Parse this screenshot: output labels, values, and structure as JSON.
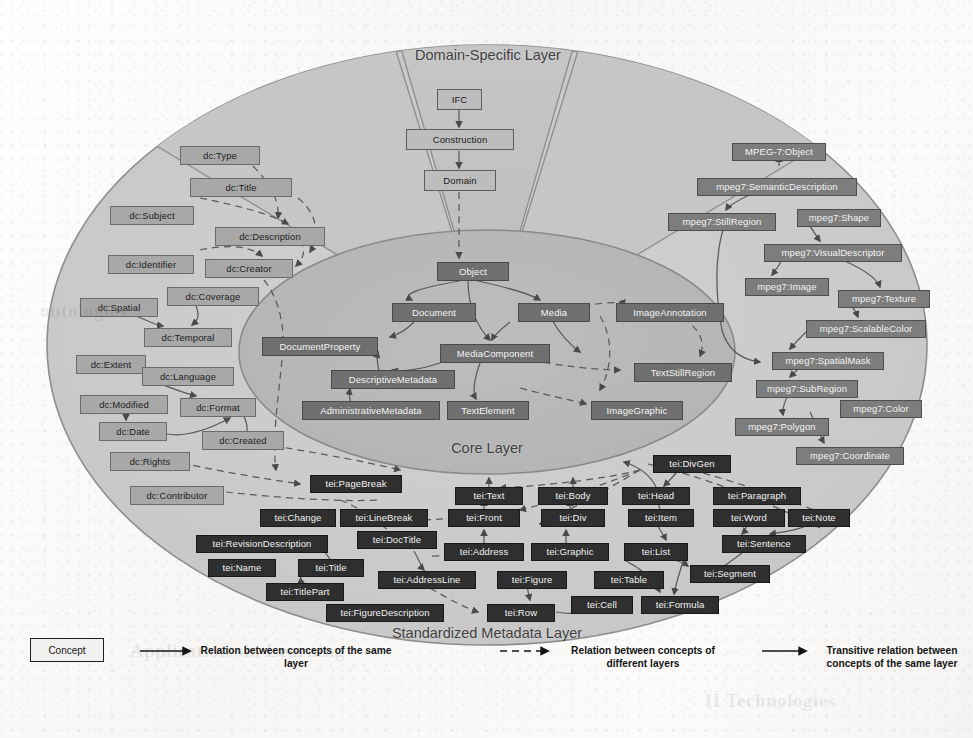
{
  "figure": {
    "layers": [
      {
        "id": "domain",
        "label": "Domain-Specific Layer"
      },
      {
        "id": "core",
        "label": "Core Layer"
      },
      {
        "id": "standard",
        "label": "Standardized Metadata Layer"
      }
    ]
  },
  "domain_nodes": [
    {
      "label": "IFC",
      "x": 437,
      "y": 89,
      "w": 45
    },
    {
      "label": "Construction",
      "x": 406,
      "y": 129,
      "w": 108
    },
    {
      "label": "Domain",
      "x": 424,
      "y": 170,
      "w": 72
    }
  ],
  "dc_nodes": [
    {
      "label": "dc:Type",
      "x": 180,
      "y": 146,
      "w": 80
    },
    {
      "label": "dc:Title",
      "x": 190,
      "y": 178,
      "w": 102
    },
    {
      "label": "dc:Subject",
      "x": 110,
      "y": 206,
      "w": 84
    },
    {
      "label": "dc:Description",
      "x": 215,
      "y": 227,
      "w": 110
    },
    {
      "label": "dc:Identifier",
      "x": 108,
      "y": 255,
      "w": 86
    },
    {
      "label": "dc:Creator",
      "x": 205,
      "y": 259,
      "w": 88
    },
    {
      "label": "dc:Coverage",
      "x": 167,
      "y": 287,
      "w": 92
    },
    {
      "label": "dc:Spatial",
      "x": 80,
      "y": 298,
      "w": 78
    },
    {
      "label": "dc:Temporal",
      "x": 144,
      "y": 328,
      "w": 88
    },
    {
      "label": "dc:Extent",
      "x": 76,
      "y": 355,
      "w": 70
    },
    {
      "label": "dc:Language",
      "x": 142,
      "y": 367,
      "w": 92
    },
    {
      "label": "dc:Modified",
      "x": 80,
      "y": 395,
      "w": 88
    },
    {
      "label": "dc:Format",
      "x": 180,
      "y": 398,
      "w": 76
    },
    {
      "label": "dc:Date",
      "x": 99,
      "y": 422,
      "w": 68
    },
    {
      "label": "dc:Created",
      "x": 202,
      "y": 431,
      "w": 82
    },
    {
      "label": "dc:Rights",
      "x": 110,
      "y": 452,
      "w": 80
    },
    {
      "label": "dc:Contributor",
      "x": 130,
      "y": 486,
      "w": 94
    }
  ],
  "mpeg7_nodes": [
    {
      "label": "MPEG-7:Object",
      "x": 732,
      "y": 143,
      "w": 94
    },
    {
      "label": "mpeg7:SemanticDescription",
      "x": 697,
      "y": 178,
      "w": 160
    },
    {
      "label": "mpeg7:StillRegion",
      "x": 668,
      "y": 213,
      "w": 108
    },
    {
      "label": "mpeg7:Shape",
      "x": 797,
      "y": 209,
      "w": 84
    },
    {
      "label": "mpeg7:VisualDescriptor",
      "x": 764,
      "y": 244,
      "w": 138
    },
    {
      "label": "mpeg7:Image",
      "x": 745,
      "y": 278,
      "w": 84
    },
    {
      "label": "mpeg7:Texture",
      "x": 838,
      "y": 290,
      "w": 92
    },
    {
      "label": "mpeg7:ScalableColor",
      "x": 806,
      "y": 320,
      "w": 120
    },
    {
      "label": "mpeg7:SpatialMask",
      "x": 772,
      "y": 352,
      "w": 112
    },
    {
      "label": "mpeg7:SubRegion",
      "x": 756,
      "y": 380,
      "w": 102
    },
    {
      "label": "mpeg7:Color",
      "x": 840,
      "y": 400,
      "w": 82
    },
    {
      "label": "mpeg7:Polygon",
      "x": 735,
      "y": 418,
      "w": 94
    },
    {
      "label": "mpeg7:Coordinate",
      "x": 796,
      "y": 447,
      "w": 108
    }
  ],
  "core_nodes": [
    {
      "label": "Object",
      "x": 437,
      "y": 262,
      "w": 72
    },
    {
      "label": "Document",
      "x": 392,
      "y": 303,
      "w": 84
    },
    {
      "label": "Media",
      "x": 518,
      "y": 303,
      "w": 72
    },
    {
      "label": "ImageAnnotation",
      "x": 616,
      "y": 303,
      "w": 108
    },
    {
      "label": "DocumentProperty",
      "x": 262,
      "y": 337,
      "w": 116
    },
    {
      "label": "MediaComponent",
      "x": 440,
      "y": 344,
      "w": 110
    },
    {
      "label": "DescriptiveMetadata",
      "x": 331,
      "y": 370,
      "w": 124
    },
    {
      "label": "TextStillRegion",
      "x": 634,
      "y": 363,
      "w": 98
    },
    {
      "label": "AdministrativeMetadata",
      "x": 302,
      "y": 401,
      "w": 138
    },
    {
      "label": "TextElement",
      "x": 447,
      "y": 401,
      "w": 82
    },
    {
      "label": "ImageGraphic",
      "x": 591,
      "y": 401,
      "w": 92
    }
  ],
  "tei_nodes": [
    {
      "label": "tei:PageBreak",
      "x": 310,
      "y": 475,
      "w": 92
    },
    {
      "label": "tei:DivGen",
      "x": 653,
      "y": 455,
      "w": 78
    },
    {
      "label": "tei:Text",
      "x": 455,
      "y": 487,
      "w": 68
    },
    {
      "label": "tei:Body",
      "x": 538,
      "y": 487,
      "w": 70
    },
    {
      "label": "tei:Head",
      "x": 622,
      "y": 487,
      "w": 68
    },
    {
      "label": "tei:Paragraph",
      "x": 713,
      "y": 487,
      "w": 88
    },
    {
      "label": "tei:Change",
      "x": 260,
      "y": 509,
      "w": 76
    },
    {
      "label": "tei:LineBreak",
      "x": 340,
      "y": 509,
      "w": 88
    },
    {
      "label": "tei:Front",
      "x": 448,
      "y": 509,
      "w": 72
    },
    {
      "label": "tei:Div",
      "x": 541,
      "y": 509,
      "w": 64
    },
    {
      "label": "tei:Item",
      "x": 628,
      "y": 509,
      "w": 66
    },
    {
      "label": "tei:Word",
      "x": 713,
      "y": 509,
      "w": 72
    },
    {
      "label": "tei:Note",
      "x": 788,
      "y": 509,
      "w": 62
    },
    {
      "label": "tei:RevisionDescription",
      "x": 196,
      "y": 535,
      "w": 132
    },
    {
      "label": "tei:DocTitle",
      "x": 357,
      "y": 531,
      "w": 80
    },
    {
      "label": "tei:Address",
      "x": 444,
      "y": 543,
      "w": 80
    },
    {
      "label": "tei:Graphic",
      "x": 531,
      "y": 543,
      "w": 78
    },
    {
      "label": "tei:List",
      "x": 624,
      "y": 543,
      "w": 64
    },
    {
      "label": "tei:Sentence",
      "x": 722,
      "y": 535,
      "w": 84
    },
    {
      "label": "tei:Name",
      "x": 208,
      "y": 559,
      "w": 68
    },
    {
      "label": "tei:Title",
      "x": 298,
      "y": 559,
      "w": 66
    },
    {
      "label": "tei:AddressLine",
      "x": 378,
      "y": 571,
      "w": 98
    },
    {
      "label": "tei:Figure",
      "x": 497,
      "y": 571,
      "w": 70
    },
    {
      "label": "tei:Table",
      "x": 594,
      "y": 571,
      "w": 70
    },
    {
      "label": "tei:Segment",
      "x": 690,
      "y": 565,
      "w": 80
    },
    {
      "label": "tei:TitlePart",
      "x": 266,
      "y": 583,
      "w": 78
    },
    {
      "label": "tei:FigureDescription",
      "x": 326,
      "y": 604,
      "w": 118
    },
    {
      "label": "tei:Row",
      "x": 487,
      "y": 604,
      "w": 68
    },
    {
      "label": "tei:Cell",
      "x": 571,
      "y": 596,
      "w": 62
    },
    {
      "label": "tei:Formula",
      "x": 641,
      "y": 596,
      "w": 78
    }
  ],
  "legend": {
    "concept_label": "Concept",
    "items": [
      {
        "style": "solid",
        "text": "Relation between concepts of the same layer"
      },
      {
        "style": "dashed",
        "text": "Relation between concepts of different layers"
      },
      {
        "style": "solid",
        "text": "Transitive relation between concepts of the same layer"
      }
    ]
  },
  "colors": {
    "domain_fill": "#c9c9c9",
    "sector_fill": "#c0c0c0",
    "outer_fill": "#cfcfcf",
    "core_fill": "#bcbcbc",
    "node_dark": "#2f2f2f",
    "node_mid": "#6f6f6f",
    "node_light": "#a8a8a8",
    "stroke": "#6a6a6a"
  },
  "ghost_text": [
    {
      "t": "Application sin Learning",
      "x": 130,
      "y": 640
    },
    {
      "t": "II Technologies",
      "x": 705,
      "y": 690
    },
    {
      "t": "ontologies",
      "x": 40,
      "y": 300
    }
  ]
}
